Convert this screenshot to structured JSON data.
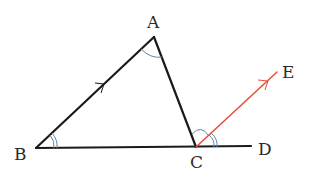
{
  "figure": {
    "type": "triangle-exterior-angle",
    "points": {
      "A": {
        "label": "A",
        "x": 154,
        "y": 37
      },
      "B": {
        "label": "B",
        "x": 36,
        "y": 148
      },
      "C": {
        "label": "C",
        "x": 196,
        "y": 147
      },
      "D": {
        "label": "D",
        "x": 251,
        "y": 146
      },
      "E": {
        "label": "E",
        "x": 277,
        "y": 72
      }
    },
    "segments": [
      {
        "from": "A",
        "to": "B",
        "color": "#1a1a1a"
      },
      {
        "from": "A",
        "to": "C",
        "color": "#1a1a1a"
      },
      {
        "from": "B",
        "to": "D",
        "color": "#1a1a1a"
      },
      {
        "from": "C",
        "to": "E",
        "color": "#e8503a",
        "note": "parallel to BA"
      }
    ],
    "parallel_marks": [
      "BA",
      "CE"
    ],
    "angle_marks": [
      {
        "vertex": "A",
        "style": "single-arc"
      },
      {
        "vertex": "B",
        "style": "double-arc"
      },
      {
        "vertex": "C",
        "between": [
          "A",
          "E"
        ],
        "style": "single-arc"
      },
      {
        "vertex": "C",
        "between": [
          "E",
          "D"
        ],
        "style": "double-arc"
      }
    ],
    "colors": {
      "line": "#1a1a1a",
      "highlight": "#e8503a",
      "arc": "#5f86a8"
    }
  }
}
